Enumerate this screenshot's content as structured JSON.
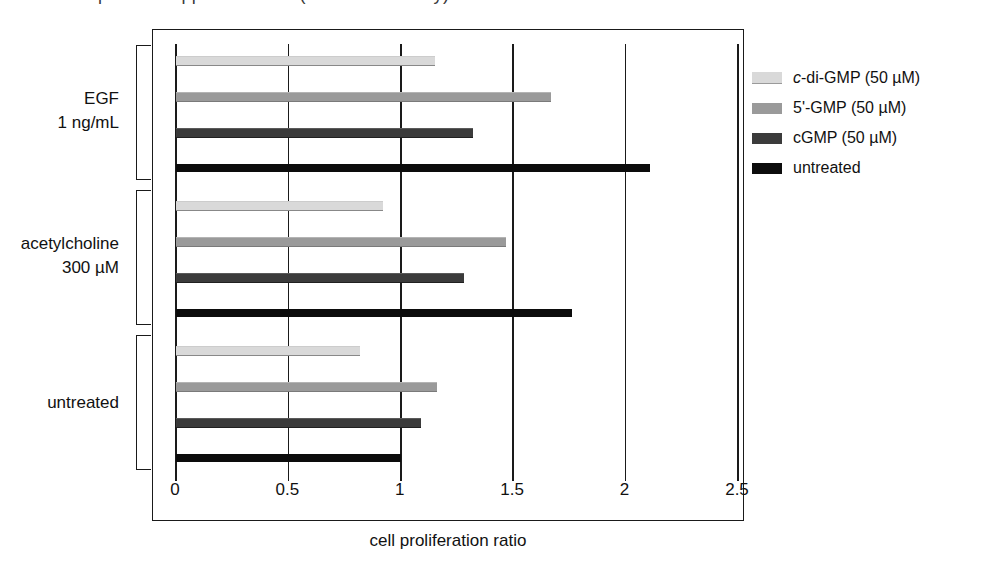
{
  "top_fragment": {
    "text": "partial cropped text line (descenders only)"
  },
  "axis": {
    "x_title": "cell proliferation ratio",
    "x_ticks": [
      "0",
      "0.5",
      "1",
      "1.5",
      "2",
      "2.5"
    ],
    "x_tick_values": [
      0,
      0.5,
      1,
      1.5,
      2,
      2.5
    ]
  },
  "groups": [
    {
      "name": "egf",
      "label_line1": "EGF",
      "label_line2": "1 ng/mL"
    },
    {
      "name": "acetylcholine",
      "label_line1": "acetylcholine",
      "label_line2": "300 µM"
    },
    {
      "name": "untreated",
      "label_line1": "untreated",
      "label_line2": ""
    }
  ],
  "legend": {
    "items": [
      {
        "name": "c-di-GMP (50 µM)",
        "italic_prefix": "c",
        "rest": "-di-GMP (50 µM)",
        "color": "#d9d9d9"
      },
      {
        "name": "5'-GMP (50 µM)",
        "italic_prefix": "",
        "rest": "5'-GMP (50 µM)",
        "color": "#9a9a9a"
      },
      {
        "name": "cGMP (50 µM)",
        "italic_prefix": "",
        "rest": "cGMP (50 µM)",
        "color": "#3b3b3b"
      },
      {
        "name": "untreated",
        "italic_prefix": "",
        "rest": "untreated",
        "color": "#0c0c0c"
      }
    ]
  },
  "chart_data": {
    "type": "bar",
    "orientation": "horizontal",
    "title": "",
    "xlabel": "cell proliferation ratio",
    "ylabel": "",
    "xlim": [
      0,
      2.5
    ],
    "xticks": [
      0,
      0.5,
      1,
      1.5,
      2,
      2.5
    ],
    "grid": "vertical gridlines at every x tick",
    "legend_position": "right",
    "categories": [
      "EGF 1 ng/mL",
      "acetylcholine 300 µM",
      "untreated"
    ],
    "series": [
      {
        "name": "c-di-GMP (50 µM)",
        "color": "#d9d9d9",
        "values": [
          1.15,
          0.92,
          0.82
        ]
      },
      {
        "name": "5'-GMP (50 µM)",
        "color": "#9a9a9a",
        "values": [
          1.67,
          1.47,
          1.16
        ]
      },
      {
        "name": "cGMP (50 µM)",
        "color": "#3b3b3b",
        "values": [
          1.32,
          1.28,
          1.09
        ]
      },
      {
        "name": "untreated",
        "color": "#0c0c0c",
        "values": [
          2.11,
          1.76,
          1.0
        ]
      }
    ]
  }
}
